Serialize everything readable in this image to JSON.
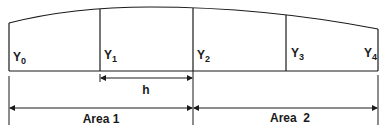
{
  "diagram": {
    "ordinates": [
      {
        "label": "Y",
        "sub": "0"
      },
      {
        "label": "Y",
        "sub": "1"
      },
      {
        "label": "Y",
        "sub": "2"
      },
      {
        "label": "Y",
        "sub": "3"
      },
      {
        "label": "Y",
        "sub": "4"
      }
    ],
    "interval_label": "h",
    "areas": [
      {
        "label": "Area 1"
      },
      {
        "label": "Area  2"
      }
    ],
    "line_color": "#1a1a1a"
  }
}
